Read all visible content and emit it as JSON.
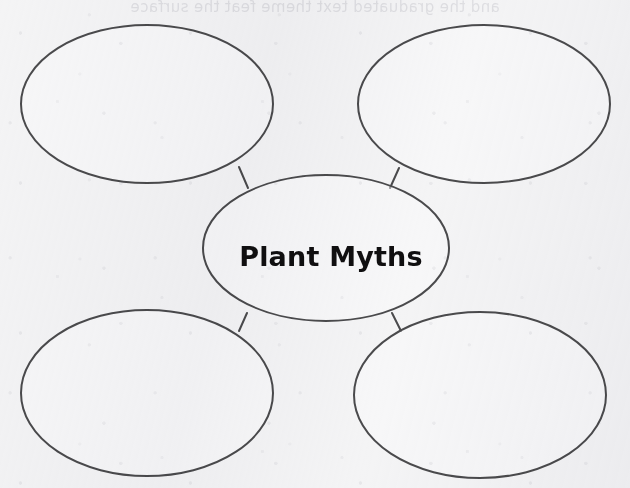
{
  "worksheet": {
    "type": "concept-web-graphic-organizer",
    "center_topic": "Plant Myths",
    "satellite_count": 4,
    "colors": {
      "page_background": "#f4f4f5",
      "ellipse_stroke": "#4a4a4c",
      "ellipse_fill": "#fbfbfc",
      "center_text": "#100f10",
      "bleed_through_text": "#c9c9cf"
    },
    "bleed_through_text": "and the graduated text theme feat the surface"
  },
  "nodes": {
    "center": {
      "id": "center",
      "label": "Plant Myths",
      "cx": 326,
      "cy": 248,
      "rx": 123,
      "ry": 73
    },
    "satellites": [
      {
        "id": "top-left",
        "label": "",
        "cx": 147,
        "cy": 104,
        "rx": 126,
        "ry": 79
      },
      {
        "id": "top-right",
        "label": "",
        "cx": 484,
        "cy": 104,
        "rx": 126,
        "ry": 79
      },
      {
        "id": "bottom-left",
        "label": "",
        "cx": 147,
        "cy": 393,
        "rx": 126,
        "ry": 83
      },
      {
        "id": "bottom-right",
        "label": "",
        "cx": 480,
        "cy": 395,
        "rx": 126,
        "ry": 83
      }
    ]
  },
  "connectors": [
    {
      "id": "connector-top-left",
      "from": "top-left",
      "to": "center",
      "x1": 239,
      "y1": 167,
      "x2": 248,
      "y2": 188
    },
    {
      "id": "connector-top-right",
      "from": "top-right",
      "to": "center",
      "x1": 399,
      "y1": 168,
      "x2": 390,
      "y2": 188
    },
    {
      "id": "connector-bottom-left",
      "from": "bottom-left",
      "to": "center",
      "x1": 247,
      "y1": 313,
      "x2": 239,
      "y2": 331
    },
    {
      "id": "connector-bottom-right",
      "from": "bottom-right",
      "to": "center",
      "x1": 392,
      "y1": 313,
      "x2": 401,
      "y2": 331
    }
  ]
}
